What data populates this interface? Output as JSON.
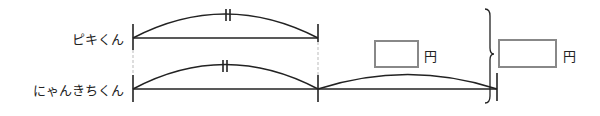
{
  "rows": [
    {
      "name": "ピキくん"
    },
    {
      "name": "にゃんきちくん"
    }
  ],
  "answer_boxes": [
    {
      "value": "",
      "unit": "円"
    },
    {
      "value": "",
      "unit": "円"
    }
  ],
  "equal_mark": "||"
}
